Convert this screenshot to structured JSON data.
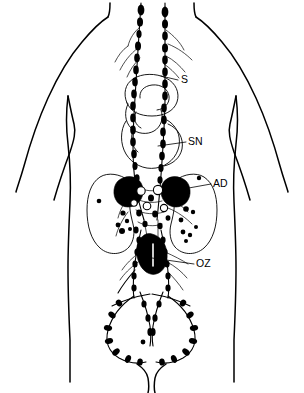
{
  "figure": {
    "background_color": "#ffffff",
    "line_color": "#000000",
    "width": 304,
    "height": 393
  },
  "labels": [
    {
      "id": "S",
      "text": "S",
      "meaning": "stomach",
      "x": 186,
      "y": 80,
      "leader_from_x": 178,
      "leader_from_y": 80,
      "leader_to_x": 161,
      "leader_to_y": 76
    },
    {
      "id": "SN",
      "text": "SN",
      "meaning": "small bowel",
      "x": 188,
      "y": 142,
      "leader_from_x": 186,
      "leader_from_y": 142,
      "leader_to_x": 158,
      "leader_to_y": 146
    },
    {
      "id": "AD",
      "text": "AD",
      "meaning": "adrenal gland",
      "x": 213,
      "y": 184,
      "leader_from_x": 211,
      "leader_from_y": 184,
      "leader_to_x": 172,
      "leader_to_y": 191
    },
    {
      "id": "OZ",
      "text": "OZ",
      "meaning": "aortic / periaortic region",
      "x": 196,
      "y": 264,
      "leader_from_x": 194,
      "leader_from_y": 264,
      "leader_to_x": 152,
      "leader_to_y": 258
    }
  ],
  "structures": {
    "torso": "human torso front outline with shoulders, arms and hips",
    "stomach": "stomach organ outline, upper abdomen",
    "small_bowel": "small bowel loop outline, mid abdomen",
    "left_kidney": "left kidney bean-shaped outline",
    "right_kidney": "right kidney bean-shaped outline",
    "left_adrenal": "left adrenal gland, filled black",
    "right_adrenal": "right adrenal gland, filled black",
    "aortic_mass": "periaortic lymph node mass, filled black",
    "thoracic_ducts": "paired ascending lymphatic duct chains with bead nodes",
    "iliac_chains": "paired pelvic iliac lymphatic chains forming an oval loop",
    "node_cluster": "dense periaortic and renal hilar lymph node cluster"
  },
  "legend": {
    "S": "stomach",
    "SN": "small bowel",
    "AD": "adrenal gland",
    "OZ": "aortic region"
  }
}
